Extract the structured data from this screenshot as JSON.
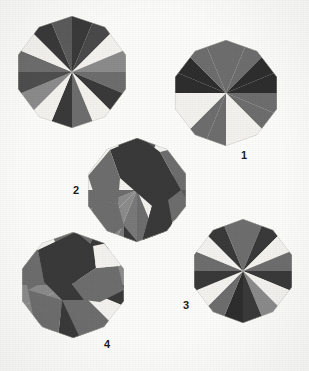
{
  "illustration": {
    "title": "Pinwheel polygon folding patterns",
    "background_color": "#fdfdfc",
    "palette": {
      "dark": "#3a3a3a",
      "darker": "#2e2e2e",
      "mid": "#6e6e6e",
      "mid_light": "#8c8c8c",
      "light": "#c9c9c6",
      "white": "#f4f3ef",
      "ink": "#1d1d1d"
    },
    "labels": [
      {
        "id": "label-1",
        "text": "1",
        "x": 241,
        "y": 150
      },
      {
        "id": "label-2",
        "text": "2",
        "x": 73,
        "y": 185
      },
      {
        "id": "label-3",
        "text": "3",
        "x": 183,
        "y": 300
      },
      {
        "id": "label-4",
        "text": "4",
        "x": 104,
        "y": 339
      }
    ],
    "figures": [
      {
        "id": "figure-top-left",
        "name": "pinwheel-top-left",
        "label": "",
        "cx": 72,
        "cy": 72,
        "r": 56,
        "sides": 10,
        "rotation": -18,
        "description": "Ten-sided polygon with alternating dark and white radial triangle pinwheel",
        "wedges": [
          "#3a3a3a",
          "#6e6e6e",
          "#f4f3ef",
          "#8c8c8c",
          "#6e6e6e",
          "#3a3a3a",
          "#f4f3ef",
          "#6e6e6e",
          "#3a3a3a",
          "#f4f3ef",
          "#8c8c8c",
          "#3a3a3a",
          "#6e6e6e",
          "#f4f3ef",
          "#3a3a3a",
          "#6e6e6e"
        ]
      },
      {
        "id": "figure-1",
        "name": "pinwheel-figure-1",
        "label": "1",
        "cx": 226,
        "cy": 93,
        "r": 53,
        "sides": 10,
        "rotation": -18,
        "description": "Checkered dark and white diamond pinwheel, label 1",
        "wedges": [
          "#6e6e6e",
          "#6e6e6e",
          "#2e2e2e",
          "#2e2e2e",
          "#6e6e6e",
          "#6e6e6e",
          "#f4f3ef",
          "#f4f3ef",
          "#6e6e6e",
          "#6e6e6e",
          "#f4f3ef",
          "#f4f3ef",
          "#2e2e2e",
          "#2e2e2e",
          "#6e6e6e",
          "#6e6e6e"
        ]
      },
      {
        "id": "figure-2",
        "name": "pinwheel-figure-2",
        "label": "2",
        "cx": 137,
        "cy": 190,
        "r": 52,
        "sides": 10,
        "rotation": -18,
        "description": "Swirled pinwheel with twisted dark S-shaped arms, label 2",
        "wedges": [
          "#3a3a3a",
          "#f4f3ef",
          "#6e6e6e",
          "#f4f3ef",
          "#6e6e6e",
          "#3a3a3a",
          "#f4f3ef",
          "#8c8c8c",
          "#3a3a3a",
          "#f4f3ef",
          "#6e6e6e",
          "#f4f3ef",
          "#6e6e6e",
          "#3a3a3a",
          "#f4f3ef",
          "#8c8c8c"
        ]
      },
      {
        "id": "figure-3",
        "name": "pinwheel-figure-3",
        "label": "3",
        "cx": 243,
        "cy": 271,
        "r": 52,
        "sides": 10,
        "rotation": -18,
        "description": "Dark and white radial pinwheel, label 3",
        "wedges": [
          "#6e6e6e",
          "#3a3a3a",
          "#f4f3ef",
          "#6e6e6e",
          "#3a3a3a",
          "#f4f3ef",
          "#8c8c8c",
          "#3a3a3a",
          "#2e2e2e",
          "#6e6e6e",
          "#f4f3ef",
          "#3a3a3a",
          "#6e6e6e",
          "#f4f3ef",
          "#3a3a3a",
          "#6e6e6e"
        ]
      },
      {
        "id": "figure-4",
        "name": "pinwheel-figure-4",
        "label": "4",
        "cx": 73,
        "cy": 285,
        "r": 53,
        "sides": 10,
        "rotation": -18,
        "description": "Swirled pinwheel with twisted dark arms, label 4",
        "wedges": [
          "#6e6e6e",
          "#3a3a3a",
          "#f4f3ef",
          "#8c8c8c",
          "#3a3a3a",
          "#f4f3ef",
          "#6e6e6e",
          "#3a3a3a",
          "#f4f3ef",
          "#8c8c8c",
          "#3a3a3a",
          "#f4f3ef",
          "#6e6e6e",
          "#3a3a3a",
          "#f4f3ef",
          "#6e6e6e"
        ]
      }
    ]
  }
}
